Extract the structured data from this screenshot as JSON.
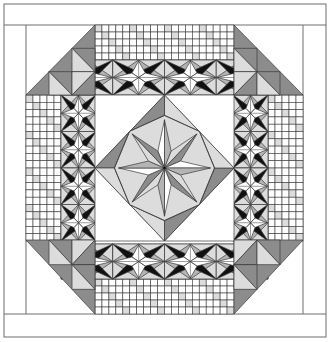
{
  "title": "Quilt pattern diagram",
  "colors": {
    "line": "#3a3a3a",
    "white": "#ffffff",
    "light": "#dcdcdc",
    "mid": "#b4b4b4",
    "dark": "#8c8c8c",
    "black": "#111111",
    "border_line": "#6e6e6e"
  },
  "layout": {
    "outer": {
      "x": 4,
      "y": 4,
      "w": 322,
      "h": 333
    },
    "inner": {
      "x": 26,
      "y": 25,
      "w": 277,
      "h": 289
    },
    "top_band_h": 21,
    "bottom_band_y": 314,
    "corner_size": 69,
    "checker_band": 35,
    "star_band": 35,
    "center": {
      "x": 95,
      "y": 95,
      "w": 139,
      "h": 146
    }
  },
  "checker": {
    "top": {
      "cols": 20,
      "rows": 5
    },
    "bottom": {
      "cols": 20,
      "rows": 5
    },
    "left": {
      "cols": 5,
      "rows": 20
    },
    "right": {
      "cols": 5,
      "rows": 20
    }
  },
  "star_bands": {
    "top_count": 4,
    "bottom_count": 4,
    "left_count": 4,
    "right_count": 4
  },
  "center_medallion": {
    "type": "eight-pointed star in diamond",
    "points": 8
  }
}
